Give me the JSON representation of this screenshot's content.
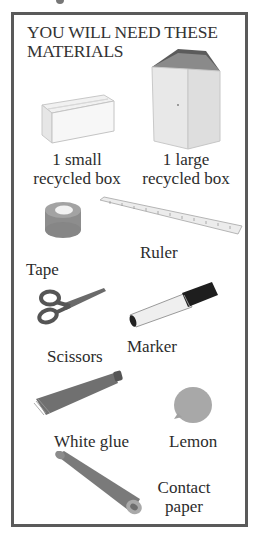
{
  "header": {
    "title_line1": "YOU WILL NEED THESE",
    "title_line2": "MATERIALS"
  },
  "materials": [
    {
      "name": "small-box",
      "icon": "small-box-icon",
      "label_line1": "1 small",
      "label_line2": "recycled box"
    },
    {
      "name": "large-box",
      "icon": "large-box-icon",
      "label_line1": "1 large",
      "label_line2": "recycled box"
    },
    {
      "name": "tape",
      "icon": "tape-icon",
      "label": "Tape"
    },
    {
      "name": "ruler",
      "icon": "ruler-icon",
      "label": "Ruler"
    },
    {
      "name": "scissors",
      "icon": "scissors-icon",
      "label": "Scissors"
    },
    {
      "name": "marker",
      "icon": "marker-icon",
      "label": "Marker"
    },
    {
      "name": "white-glue",
      "icon": "glue-tube-icon",
      "label": "White glue"
    },
    {
      "name": "lemon",
      "icon": "lemon-icon",
      "label": "Lemon"
    },
    {
      "name": "contact-paper",
      "icon": "paper-roll-icon",
      "label_line1": "Contact",
      "label_line2": "paper"
    }
  ],
  "colors": {
    "frame_border": "#5a5a5a",
    "text": "#2c2c2c",
    "background": "#ffffff"
  }
}
